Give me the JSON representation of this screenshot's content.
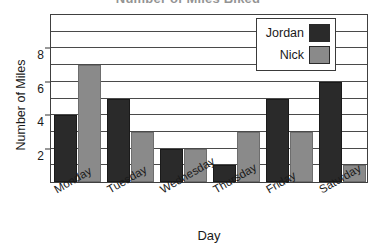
{
  "chart_data": {
    "type": "bar",
    "title": "Number of Miles Biked",
    "xlabel": "Day",
    "ylabel": "Number of Miles",
    "categories": [
      "Monday",
      "Tuesday",
      "Wednesday",
      "Thursday",
      "Friday",
      "Saturday"
    ],
    "series": [
      {
        "name": "Jordan",
        "color": "#2a2a2a",
        "values": [
          4,
          5,
          2,
          1,
          5,
          6
        ]
      },
      {
        "name": "Nick",
        "color": "#8a8a8a",
        "values": [
          7,
          3,
          2,
          3,
          3,
          1
        ]
      }
    ],
    "ylim": [
      0,
      10
    ],
    "y_ticks": [
      2,
      4,
      6,
      8
    ],
    "y_tick_labels": [
      "2",
      "4",
      "6",
      "8"
    ],
    "gridlines": [
      1,
      2,
      3,
      4,
      5,
      6,
      7,
      8,
      9
    ],
    "grid": true,
    "legend_position": "top-right"
  }
}
